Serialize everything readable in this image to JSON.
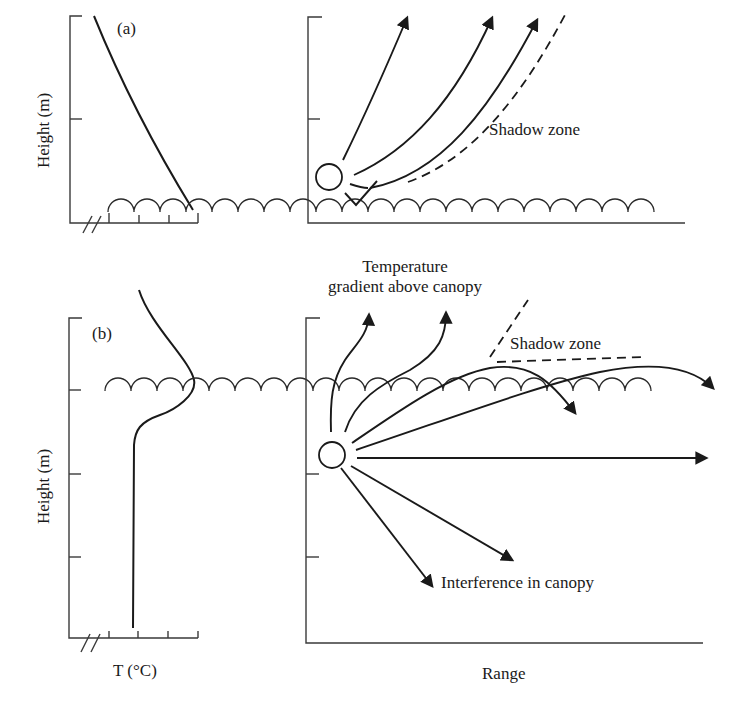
{
  "figure": {
    "panel_a": {
      "label": "(a)",
      "y_axis_label": "Height (m)",
      "annotations": {
        "shadow_zone": "Shadow zone"
      },
      "description": "Temperature decreases with height (lapse); sound rays from ground source refract upward, creating a shadow zone near ground."
    },
    "panel_b": {
      "label": "(b)",
      "y_axis_label": "Height (m)",
      "x_axis_label_left": "T (°C)",
      "x_axis_label_right": "Range",
      "annotations": {
        "temperature_gradient": [
          "Temperature",
          "gradient above canopy"
        ],
        "shadow_zone": "Shadow zone",
        "interference": "Interference in canopy"
      },
      "description": "Temperature maximum at canopy top; rays below canopy ducted, some escape upward; interference within canopy."
    }
  },
  "colors": {
    "ink": "#1a1a1a",
    "axis": "#3a3a3a",
    "background": "#ffffff"
  }
}
